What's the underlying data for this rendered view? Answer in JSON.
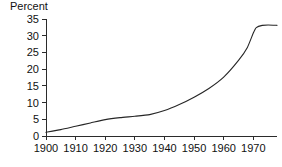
{
  "chart_data": {
    "type": "line",
    "title": "",
    "xlabel": "",
    "ylabel": "Percent",
    "ylim": [
      0,
      35
    ],
    "xlim": [
      1900,
      1978
    ],
    "grid": false,
    "legend": null,
    "y_ticks": [
      "0",
      "5",
      "10",
      "15",
      "20",
      "25",
      "30",
      "35"
    ],
    "y_tick_values": [
      0,
      5,
      10,
      15,
      20,
      25,
      30,
      35
    ],
    "x_ticks": [
      "1900",
      "1910",
      "1920",
      "1930",
      "1940",
      "1950",
      "1960",
      "1970"
    ],
    "x_tick_values": [
      1900,
      1910,
      1920,
      1930,
      1940,
      1950,
      1960,
      1970
    ],
    "series": [
      {
        "name": "Percent",
        "x": [
          1900,
          1905,
          1910,
          1915,
          1920,
          1925,
          1930,
          1935,
          1940,
          1945,
          1950,
          1955,
          1960,
          1965,
          1968,
          1970,
          1971,
          1973,
          1975,
          1978
        ],
        "values": [
          1.1,
          1.9,
          2.9,
          3.9,
          4.9,
          5.5,
          5.9,
          6.4,
          7.6,
          9.4,
          11.6,
          14.2,
          17.6,
          22.6,
          26.5,
          30.8,
          32.4,
          33.1,
          33.2,
          33.1
        ]
      }
    ],
    "line_color": "#262626",
    "axis_color": "#2b2b2b",
    "background_color": "#ffffff"
  }
}
